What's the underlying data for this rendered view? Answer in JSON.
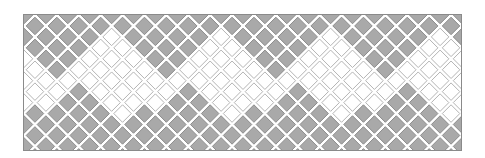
{
  "pattern": {
    "name": "diamond-zigzag-tile-band",
    "frame": {
      "x": 23,
      "y": 14,
      "width": 439,
      "height": 137
    },
    "tile": {
      "pitch_x": 21.9,
      "pitch_y": 21.9,
      "inset": 2.2
    },
    "colors": {
      "gray_fill": "#a9a9a9",
      "gray_stroke": "#8c8c8c",
      "white_fill": "#ffffff",
      "white_stroke": "#b4b4b4",
      "gap": "#ffffff",
      "frame_border": "#8a8a8a"
    },
    "zigzag": {
      "period_px": 109.5,
      "top_gray_min_row": 2,
      "top_gray_max_row": 6,
      "top_phase_px": 60,
      "bottom_gray_min_row": 7,
      "bottom_gray_max_row": 10,
      "bottom_phase_px": 75,
      "rows": 13
    }
  }
}
